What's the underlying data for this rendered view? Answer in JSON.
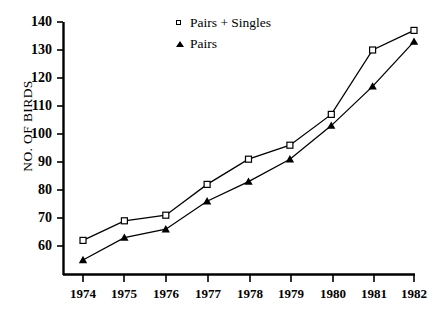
{
  "chart_data": {
    "type": "line",
    "title": "",
    "xlabel": "",
    "ylabel": "NO. OF BIRDS",
    "categories": [
      "1974",
      "1975",
      "1976",
      "1977",
      "1978",
      "1979",
      "1980",
      "1981",
      "1982"
    ],
    "x": [
      1974,
      1975,
      1976,
      1977,
      1978,
      1979,
      1980,
      1981,
      1982
    ],
    "series": [
      {
        "name": "Pairs + Singles",
        "marker": "open-square",
        "values": [
          62,
          69,
          71,
          82,
          91,
          96,
          107,
          130,
          137
        ]
      },
      {
        "name": "Pairs",
        "marker": "filled-triangle",
        "values": [
          55,
          63,
          66,
          76,
          83,
          91,
          103,
          117,
          133
        ]
      }
    ],
    "ylim": [
      52,
      140
    ],
    "yticks": [
      60,
      70,
      80,
      90,
      100,
      110,
      120,
      130,
      140
    ],
    "xlim": [
      1973.6,
      1982.4
    ],
    "grid": false,
    "legend_position": "top-center"
  },
  "legend": {
    "entries": [
      {
        "label": "Pairs + Singles",
        "marker": "open-square"
      },
      {
        "label": "Pairs",
        "marker": "filled-triangle"
      }
    ]
  },
  "axes": {
    "y_title": "NO. OF BIRDS",
    "y_tick_labels": [
      "140",
      "130",
      "120",
      "110",
      "100",
      "90",
      "80",
      "70",
      "60"
    ],
    "x_tick_labels": [
      "1974",
      "1975",
      "1976",
      "1977",
      "1978",
      "1979",
      "1980",
      "1981",
      "1982"
    ]
  },
  "colors": {
    "line": "#000000",
    "axis": "#000000",
    "background": "#ffffff",
    "marker_fill_open": "#ffffff",
    "marker_fill_solid": "#000000"
  }
}
